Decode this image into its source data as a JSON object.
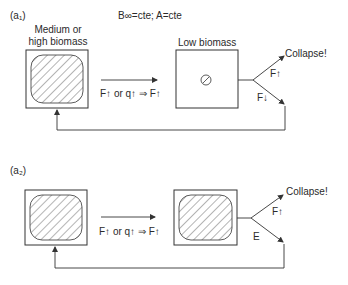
{
  "panels": [
    {
      "id": "a1",
      "label": "(a₁)",
      "condition": "B∞=cte; A=cte",
      "left_box": {
        "title": "Medium or high biomass",
        "title_line1": "Medium or",
        "title_line2": "high biomass",
        "fill": "hatched-large"
      },
      "transition": {
        "label": "F↑ or q↑ ⇒ F↑"
      },
      "right_box": {
        "title": "Low biomass",
        "fill": "hatched-small"
      },
      "fork": {
        "up_label": "F↑",
        "down_label": "F↓",
        "outcome": "Collapse!"
      }
    },
    {
      "id": "a2",
      "label": "(a₂)",
      "left_box": {
        "fill": "hatched-large"
      },
      "transition": {
        "label": "F↑ or q↑ ⇒ F↑"
      },
      "right_box": {
        "fill": "hatched-large"
      },
      "fork": {
        "up_label": "F↑",
        "down_label": "E",
        "outcome": "Collapse!"
      }
    }
  ],
  "colors": {
    "line": "#333333",
    "background": "#ffffff"
  }
}
